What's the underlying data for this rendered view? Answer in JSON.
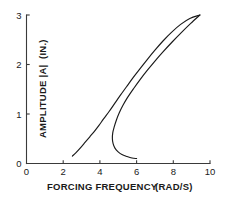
{
  "chart_data": {
    "type": "line",
    "title": "",
    "subtitle": "",
    "xlabel": "FORCING FREQUENCY",
    "xunit": "(RAD/S)",
    "ylabel": "AMPLITUDE |A|",
    "yunit": "(IN.)",
    "xlim": [
      0,
      10
    ],
    "ylim": [
      0,
      3
    ],
    "xticks": [
      0,
      2,
      4,
      6,
      8,
      10
    ],
    "xtick_labels": [
      "0",
      "2",
      "4",
      "6",
      "8",
      "10"
    ],
    "yticks": [
      0,
      1,
      2,
      3
    ],
    "ytick_labels": [
      "0",
      "1",
      "2",
      "3"
    ],
    "grid": false,
    "legend": false,
    "legend_position": "none",
    "line_color": "#1a1a1a",
    "axis_color": "#3a3a3a",
    "background_color": "#ffffff",
    "annotations": [],
    "series": [
      {
        "name": "upper-branch",
        "points": [
          [
            2.5,
            0.15
          ],
          [
            2.7,
            0.22
          ],
          [
            2.95,
            0.32
          ],
          [
            3.2,
            0.43
          ],
          [
            3.45,
            0.54
          ],
          [
            3.7,
            0.65
          ],
          [
            3.95,
            0.77
          ],
          [
            4.2,
            0.9
          ],
          [
            4.5,
            1.05
          ],
          [
            4.8,
            1.21
          ],
          [
            5.1,
            1.37
          ],
          [
            5.45,
            1.55
          ],
          [
            5.8,
            1.73
          ],
          [
            6.2,
            1.92
          ],
          [
            6.6,
            2.11
          ],
          [
            7.0,
            2.29
          ],
          [
            7.45,
            2.48
          ],
          [
            7.9,
            2.65
          ],
          [
            8.4,
            2.81
          ],
          [
            8.9,
            2.93
          ],
          [
            9.45,
            3.0
          ]
        ]
      },
      {
        "name": "unstable-branch",
        "points": [
          [
            9.45,
            3.0
          ],
          [
            8.95,
            2.83
          ],
          [
            8.45,
            2.65
          ],
          [
            7.95,
            2.46
          ],
          [
            7.45,
            2.26
          ],
          [
            7.0,
            2.07
          ],
          [
            6.6,
            1.89
          ],
          [
            6.2,
            1.7
          ],
          [
            5.85,
            1.52
          ],
          [
            5.5,
            1.33
          ],
          [
            5.25,
            1.17
          ],
          [
            5.05,
            1.02
          ],
          [
            4.9,
            0.88
          ],
          [
            4.78,
            0.74
          ],
          [
            4.7,
            0.62
          ],
          [
            4.68,
            0.5
          ],
          [
            4.72,
            0.4
          ],
          [
            4.82,
            0.31
          ],
          [
            4.98,
            0.24
          ],
          [
            5.2,
            0.18
          ],
          [
            5.48,
            0.14
          ],
          [
            5.75,
            0.11
          ],
          [
            6.0,
            0.1
          ]
        ]
      }
    ]
  },
  "axes": {
    "y_axis_title": "AMPLITUDE |A|",
    "y_axis_unit": "(IN.)",
    "x_axis_title": "FORCING FREQUENCY",
    "x_axis_unit": "(RAD/S)"
  }
}
